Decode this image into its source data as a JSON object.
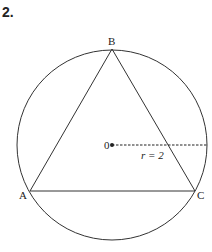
{
  "problem_number": "2.",
  "diagram": {
    "circle": {
      "center_label": "0",
      "radius_label": "r = 2"
    },
    "vertices": {
      "A": "A",
      "B": "B",
      "C": "C"
    }
  }
}
